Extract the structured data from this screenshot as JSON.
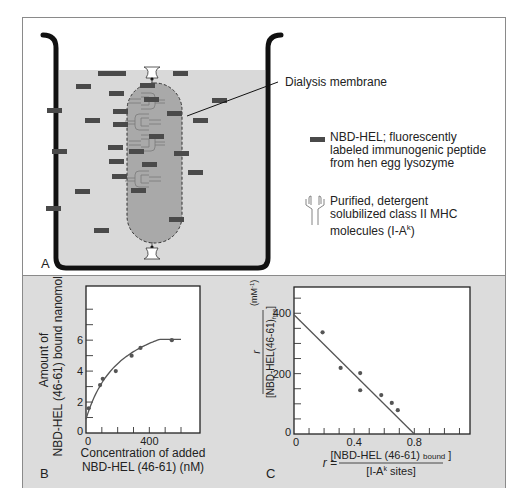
{
  "panel_a": {
    "letter": "A",
    "membrane_label": "Dialysis membrane",
    "legend": [
      {
        "icon": "peptide-rect-icon",
        "lines": [
          "NBD-HEL; fluorescently",
          "labeled immunogenic peptide",
          "from hen egg lysozyme"
        ]
      },
      {
        "icon": "mhc-molecule-icon",
        "lines": [
          "Purified, detergent",
          "solubilized class II MHC",
          "molecules (I-A",
          "k",
          ")"
        ]
      }
    ],
    "colors": {
      "solution": "#d9d9d9",
      "bag": "#a9a9a9",
      "peptide": "#4a4a4a",
      "beaker": "#111111",
      "mhc": "#8a8a8a"
    }
  },
  "panel_b": {
    "letter": "B"
  },
  "panel_c": {
    "letter": "C"
  },
  "chart_data": [
    {
      "type": "scatter",
      "panel": "B",
      "title": "",
      "xlabel": [
        "Concentration of added",
        "NBD-HEL (46-61) (nM)"
      ],
      "ylabel": [
        "Amount of",
        "NBD-HEL (46-61) bound nanomoles"
      ],
      "xlim": [
        0,
        720
      ],
      "ylim": [
        0,
        9.5
      ],
      "x_ticks": [
        0,
        100,
        200,
        300,
        400,
        500,
        600
      ],
      "x_tick_labels": [
        {
          "value": 0,
          "label": "0"
        },
        {
          "value": 400,
          "label": "400"
        }
      ],
      "y_ticks": [
        0,
        1,
        2,
        3,
        4,
        5,
        6,
        7,
        8
      ],
      "y_tick_labels": [
        {
          "value": 0,
          "label": "0"
        },
        {
          "value": 2,
          "label": "2"
        },
        {
          "value": 4,
          "label": "4"
        },
        {
          "value": 6,
          "label": "6"
        }
      ],
      "points": [
        {
          "x": 17,
          "y": 1.6
        },
        {
          "x": 89,
          "y": 3.1
        },
        {
          "x": 106,
          "y": 3.5
        },
        {
          "x": 188,
          "y": 4.0
        },
        {
          "x": 288,
          "y": 5.0
        },
        {
          "x": 344,
          "y": 5.5
        },
        {
          "x": 542,
          "y": 6.0
        }
      ],
      "fit": {
        "kind": "saturation",
        "bmax": 8.6,
        "kd": 230,
        "offset": 0.9,
        "x_range": [
          0,
          600
        ]
      },
      "grid": false
    },
    {
      "type": "scatter",
      "panel": "C",
      "title": "",
      "xlabel": {
        "lhs": "r =",
        "numerator": "[NBD-HEL (46-61)",
        "numerator_sub": "bound",
        "numerator_close": "]",
        "denominator": "[I-A",
        "denominator_sup": "k",
        "denominator_tail": " sites]"
      },
      "ylabel": {
        "numerator": "r",
        "denominator": "[NBD-HEL(46-61)",
        "denominator_sub": "free",
        "denominator_close": "]",
        "units": "(mM",
        "units_sup": "-1",
        "units_close": ")"
      },
      "xlim": [
        0,
        1.17
      ],
      "ylim": [
        0,
        487
      ],
      "x_ticks": [
        0,
        0.1,
        0.2,
        0.3,
        0.4,
        0.5,
        0.6,
        0.7,
        0.8,
        0.9,
        1.0,
        1.1
      ],
      "x_tick_labels": [
        {
          "value": 0,
          "label": "0"
        },
        {
          "value": 0.4,
          "label": "0.4"
        },
        {
          "value": 0.8,
          "label": "0.8"
        }
      ],
      "y_ticks": [
        0,
        50,
        100,
        150,
        200,
        250,
        300,
        350,
        400,
        450
      ],
      "y_tick_labels": [
        {
          "value": 0,
          "label": "0"
        },
        {
          "value": 200,
          "label": "200"
        },
        {
          "value": 400,
          "label": "400"
        }
      ],
      "points": [
        {
          "x": 0.19,
          "y": 337
        },
        {
          "x": 0.31,
          "y": 219
        },
        {
          "x": 0.44,
          "y": 202
        },
        {
          "x": 0.44,
          "y": 145
        },
        {
          "x": 0.58,
          "y": 129
        },
        {
          "x": 0.65,
          "y": 103
        },
        {
          "x": 0.69,
          "y": 79
        }
      ],
      "fit": {
        "kind": "linear",
        "x0": 0,
        "y0": 395,
        "x1": 0.8,
        "y1": 0
      },
      "grid": false
    }
  ]
}
